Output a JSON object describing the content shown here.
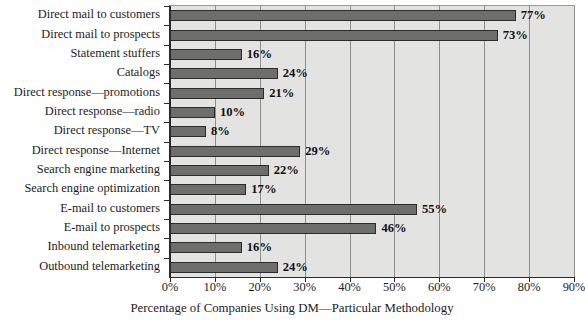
{
  "chart_data": {
    "type": "bar",
    "orientation": "horizontal",
    "title": "",
    "xlabel": "Percentage of Companies Using DM—Particular Methodology",
    "ylabel": "",
    "xlim": [
      0,
      90
    ],
    "xtick_labels": [
      "0%",
      "10%",
      "20%",
      "30%",
      "40%",
      "50%",
      "60%",
      "70%",
      "80%",
      "90%"
    ],
    "xtick_values": [
      0,
      10,
      20,
      30,
      40,
      50,
      60,
      70,
      80,
      90
    ],
    "grid": true,
    "legend": null,
    "categories": [
      "Direct mail to customers",
      "Direct mail to prospects",
      "Statement stuffers",
      "Catalogs",
      "Direct response—promotions",
      "Direct response—radio",
      "Direct response—TV",
      "Direct response—Internet",
      "Search engine marketing",
      "Search engine optimization",
      "E-mail to customers",
      "E-mail to prospects",
      "Inbound telemarketing",
      "Outbound telemarketing"
    ],
    "values": [
      77,
      73,
      16,
      24,
      21,
      10,
      8,
      29,
      22,
      17,
      55,
      46,
      16,
      24
    ],
    "data_labels": [
      "77%",
      "73%",
      "16%",
      "24%",
      "21%",
      "10%",
      "8%",
      "29%",
      "22%",
      "17%",
      "55%",
      "46%",
      "16%",
      "24%"
    ],
    "colors": {
      "bar_fill": "#6e6e6c",
      "bar_stroke": "#2b2b2b",
      "plot_background": "#e3e3e1",
      "gridline": "#8e8e8c",
      "axis": "#2a2a2a",
      "text": "#1c1c1c"
    }
  }
}
